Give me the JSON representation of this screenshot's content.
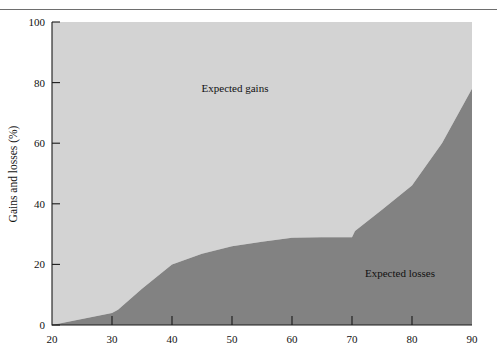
{
  "figure": {
    "background_color": "#ffffff",
    "top_rule": true,
    "top_rule_color": "#6e6e6e"
  },
  "chart_data": {
    "type": "area",
    "title": "",
    "subtitle": "",
    "xlabel": "",
    "ylabel": "Gains and losses (%)",
    "xlim": [
      20,
      90
    ],
    "ylim": [
      0,
      100
    ],
    "grid": false,
    "legend_position": "inline-annotations",
    "x_ticks": [
      20,
      30,
      40,
      50,
      60,
      70,
      80,
      90
    ],
    "x_tick_labels": [
      "20",
      "30",
      "40",
      "50",
      "60",
      "70",
      "80",
      "90"
    ],
    "y_ticks": [
      0,
      20,
      40,
      60,
      80,
      100
    ],
    "y_tick_labels": [
      "0",
      "20",
      "40",
      "60",
      "80",
      "100"
    ],
    "x": [
      20,
      25,
      30,
      31,
      35,
      40,
      45,
      50,
      55,
      60,
      65,
      70,
      70.5,
      75,
      80,
      85,
      90
    ],
    "series": [
      {
        "name": "Expected losses",
        "color": "#828282",
        "stack_order": 1,
        "values": [
          0,
          2,
          4,
          5,
          12,
          20,
          23.5,
          26,
          27.5,
          28.8,
          29,
          29,
          31,
          38,
          46,
          60,
          78
        ]
      },
      {
        "name": "Expected gains",
        "color": "#d3d3d3",
        "stack_order": 2,
        "values": [
          100,
          98,
          96,
          95,
          88,
          80,
          76.5,
          74,
          72.5,
          71.2,
          71,
          71,
          69,
          62,
          54,
          40,
          22
        ]
      }
    ],
    "annotations": [
      {
        "text": "Expected gains",
        "x": 50.5,
        "y": 77,
        "color": "#111111"
      },
      {
        "text": "Expected losses",
        "x": 78,
        "y": 16,
        "color": "#111111"
      }
    ]
  },
  "axis_title": {
    "y": "Gains and losses (%)"
  }
}
